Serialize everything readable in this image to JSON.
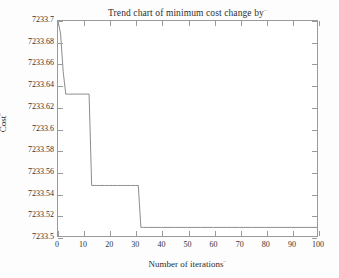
{
  "chart_data": {
    "type": "line",
    "title": "Trend chart of minimum cost change by",
    "title_mark": "⎯",
    "xlabel": "Number of iterations",
    "xlabel_mark": "⎯",
    "ylabel": "Cost",
    "ylabel_mark": "⎯",
    "xlim": [
      0,
      100
    ],
    "ylim": [
      7233.5,
      7233.7
    ],
    "xticks": [
      0,
      10,
      20,
      30,
      40,
      50,
      60,
      70,
      80,
      90,
      100
    ],
    "xtick_labels": [
      "0",
      "10",
      "20",
      "30",
      "40",
      "50",
      "60",
      "70",
      "80",
      "90",
      "100"
    ],
    "yticks": [
      7233.5,
      7233.52,
      7233.54,
      7233.56,
      7233.58,
      7233.6,
      7233.62,
      7233.64,
      7233.66,
      7233.68,
      7233.7
    ],
    "ytick_labels": [
      "7233.5",
      "7233.52",
      "7233.54",
      "7233.56",
      "7233.58",
      "7233.6",
      "7233.62",
      "7233.64",
      "7233.66",
      "7233.68",
      "7233.7"
    ],
    "grid": false,
    "legend": null,
    "line_color": "#8c8c8c",
    "line_width": 1,
    "series": [
      {
        "name": "minimum cost",
        "x": [
          0,
          1,
          2,
          3,
          4,
          5,
          6,
          7,
          8,
          9,
          10,
          11,
          12,
          13,
          14,
          15,
          16,
          17,
          18,
          19,
          20,
          21,
          22,
          23,
          24,
          25,
          26,
          27,
          28,
          29,
          30,
          31,
          32,
          33,
          34,
          35,
          40,
          45,
          50,
          55,
          60,
          65,
          70,
          75,
          80,
          85,
          90,
          95,
          100
        ],
        "values": [
          7233.7,
          7233.688,
          7233.653,
          7233.632,
          7233.632,
          7233.632,
          7233.632,
          7233.632,
          7233.632,
          7233.632,
          7233.632,
          7233.632,
          7233.632,
          7233.547,
          7233.547,
          7233.547,
          7233.547,
          7233.547,
          7233.547,
          7233.547,
          7233.547,
          7233.547,
          7233.547,
          7233.547,
          7233.547,
          7233.547,
          7233.547,
          7233.547,
          7233.547,
          7233.547,
          7233.547,
          7233.547,
          7233.508,
          7233.508,
          7233.508,
          7233.508,
          7233.508,
          7233.508,
          7233.508,
          7233.508,
          7233.508,
          7233.508,
          7233.508,
          7233.508,
          7233.508,
          7233.508,
          7233.508,
          7233.508,
          7233.508
        ]
      }
    ],
    "annotations": []
  }
}
